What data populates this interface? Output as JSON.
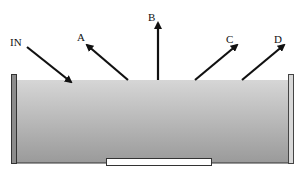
{
  "diagram": {
    "labels": {
      "incoming": "IN",
      "a": "A",
      "b": "B",
      "c": "C",
      "d": "D"
    },
    "colors": {
      "arrow": "#111111",
      "liquid_top": "#d4d4d4",
      "liquid_bottom": "#9c9c9c",
      "wall_fill": "#8a8a8a",
      "wall_stroke": "#333333",
      "slot_fill": "#ffffff"
    }
  }
}
